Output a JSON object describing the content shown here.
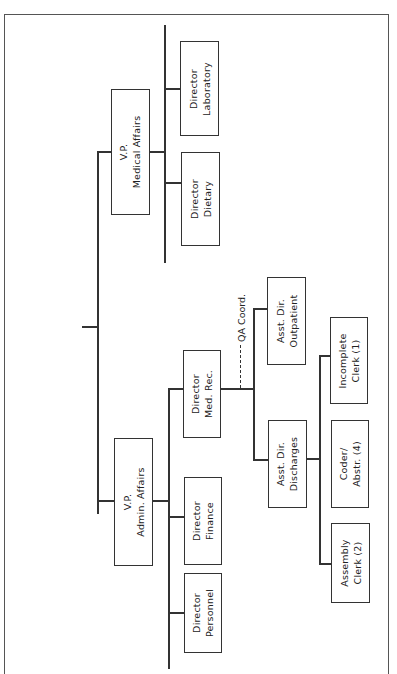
{
  "chart": {
    "top": {
      "name": "root-connector"
    },
    "vp_admin": {
      "line1": "V.P.",
      "line2": "Admin. Affairs"
    },
    "vp_medical": {
      "line1": "V.P.",
      "line2": "Medical Affairs"
    },
    "dir_personnel": {
      "line1": "Director",
      "line2": "Personnel"
    },
    "dir_finance": {
      "line1": "Director",
      "line2": "Finance"
    },
    "dir_medrec": {
      "line1": "Director",
      "line2": "Med. Rec."
    },
    "dir_dietary": {
      "line1": "Director",
      "line2": "Dietary"
    },
    "dir_laboratory": {
      "line1": "Director",
      "line2": "Laboratory"
    },
    "qa_coord": "QA Coord.",
    "asst_discharges": {
      "line1": "Asst. Dir.",
      "line2": "Discharges"
    },
    "asst_outpatient": {
      "line1": "Asst. Dir.",
      "line2": "Outpatient"
    },
    "assembly_clerk": {
      "line1": "Assembly",
      "line2": "Clerk (2)"
    },
    "coder_abstr": {
      "line1": "Coder/",
      "line2": "Abstr. (4)"
    },
    "incomplete_clerk": {
      "line1": "Incomplete",
      "line2": "Clerk (1)"
    }
  }
}
